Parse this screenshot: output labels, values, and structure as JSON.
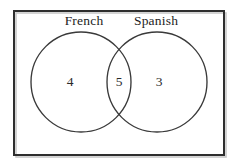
{
  "figure": {
    "type": "venn-diagram",
    "background_color": "#ffffff",
    "frame": {
      "stroke_color": "#2e2e2e",
      "shadow_color": "#c9c9c9",
      "x": 14,
      "y": 11,
      "width": 210,
      "height": 144
    }
  },
  "sets": [
    {
      "key": "french",
      "label": "French",
      "label_x": 84,
      "label_y": 25,
      "circle": {
        "cx": 81,
        "cy": 82,
        "r": 50
      },
      "stroke_color": "#3a3a3a"
    },
    {
      "key": "spanish",
      "label": "Spanish",
      "label_x": 156,
      "label_y": 25,
      "circle": {
        "cx": 157,
        "cy": 82,
        "r": 50
      },
      "stroke_color": "#3a3a3a"
    }
  ],
  "regions": [
    {
      "key": "french-only",
      "value": "4",
      "x": 70,
      "y": 83,
      "description": "French only"
    },
    {
      "key": "both",
      "value": "5",
      "x": 119,
      "y": 83,
      "description": "French and Spanish"
    },
    {
      "key": "spanish-only",
      "value": "3",
      "x": 159,
      "y": 83,
      "description": "Spanish only"
    }
  ]
}
